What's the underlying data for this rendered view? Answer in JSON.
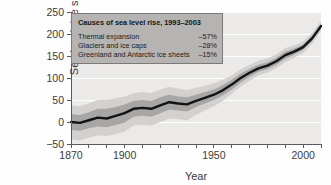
{
  "chart_data": {
    "type": "line",
    "title": "",
    "xlabel": "Year",
    "ylabel": "Sea level rise since 1870 (mm)",
    "ylabel_line1": "Sea level rise since 1870",
    "ylabel_line2": "(mm)",
    "xlim": [
      1870,
      2010
    ],
    "ylim": [
      -50,
      250
    ],
    "xticks": [
      1870,
      1880,
      1890,
      1900,
      1910,
      1920,
      1930,
      1940,
      1950,
      1960,
      1970,
      1980,
      1990,
      2000,
      2010
    ],
    "xtick_labels": [
      "1870",
      "",
      "",
      "1900",
      "",
      "",
      "",
      "",
      "1950",
      "",
      "",
      "",
      "",
      "2000",
      ""
    ],
    "xtick_labels_shown": [
      "1870",
      "1900",
      "1950",
      "2000"
    ],
    "yticks": [
      -50,
      0,
      50,
      100,
      150,
      200,
      250
    ],
    "ytick_labels": [
      "−50",
      "0",
      "50",
      "100",
      "150",
      "200",
      "250"
    ],
    "grid": true,
    "grid_color": "#ffffff",
    "plot_background": "#eceae8",
    "line_color": "#131313",
    "band_outer_color": "#d3d1cf",
    "band_inner_color": "#a8a6a4",
    "series": [
      {
        "name": "Sea level rise since 1870",
        "x": [
          1870,
          1875,
          1880,
          1885,
          1890,
          1895,
          1900,
          1905,
          1910,
          1915,
          1920,
          1925,
          1930,
          1935,
          1940,
          1945,
          1950,
          1955,
          1960,
          1965,
          1970,
          1975,
          1980,
          1985,
          1990,
          1995,
          2000,
          2005,
          2010
        ],
        "values": [
          0,
          -2,
          4,
          10,
          8,
          14,
          20,
          30,
          32,
          30,
          38,
          45,
          42,
          40,
          48,
          55,
          62,
          72,
          85,
          100,
          112,
          122,
          128,
          138,
          152,
          160,
          170,
          190,
          218
        ],
        "band_inner_upper": [
          18,
          16,
          22,
          30,
          30,
          34,
          40,
          48,
          50,
          48,
          56,
          62,
          58,
          56,
          62,
          68,
          74,
          84,
          96,
          110,
          121,
          130,
          136,
          146,
          160,
          167,
          176,
          196,
          224
        ],
        "band_inner_lower": [
          -18,
          -20,
          -14,
          -10,
          -12,
          -7,
          -1,
          12,
          14,
          12,
          20,
          28,
          26,
          24,
          34,
          42,
          50,
          60,
          74,
          90,
          103,
          114,
          120,
          130,
          144,
          153,
          164,
          184,
          212
        ],
        "band_outer_upper": [
          38,
          36,
          42,
          50,
          50,
          54,
          58,
          66,
          68,
          66,
          74,
          80,
          76,
          72,
          78,
          82,
          88,
          96,
          106,
          120,
          130,
          139,
          145,
          154,
          168,
          174,
          183,
          202,
          230
        ],
        "band_outer_lower": [
          -40,
          -42,
          -36,
          -30,
          -32,
          -28,
          -22,
          -8,
          -6,
          -8,
          0,
          8,
          6,
          4,
          16,
          26,
          36,
          48,
          64,
          80,
          94,
          106,
          112,
          122,
          136,
          146,
          157,
          178,
          206
        ]
      }
    ]
  },
  "annotation": {
    "title": "Causes of sea level rise, 1993–2003",
    "rows": [
      {
        "label": "Thermal expansion",
        "value": "–57%"
      },
      {
        "label": "Glaciers and ice caps",
        "value": "–28%"
      },
      {
        "label": "Greenland and Antarctic ice sheets",
        "value": "–15%"
      }
    ]
  }
}
